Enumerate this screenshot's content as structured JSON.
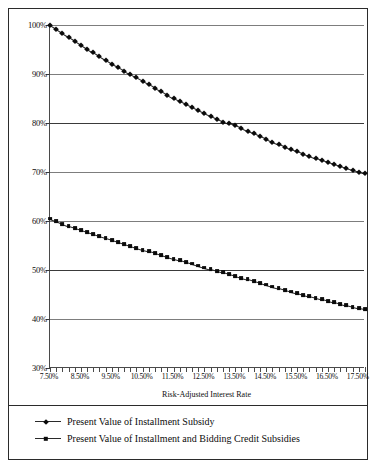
{
  "figure": {
    "xaxis_title": "Risk-Adjusted Interest Rate",
    "border_color": "#2b2b2b",
    "background": "#ffffff"
  },
  "legend": {
    "items": [
      {
        "label": "Present Value of Installment Subsidy",
        "marker": "diamond-marker",
        "color": "#0b0b0b"
      },
      {
        "label": "Present Value of Installment and Bidding Credit Subsidies",
        "marker": "square-marker",
        "color": "#0b0b0b"
      }
    ]
  },
  "chart_data": {
    "type": "line",
    "title": "",
    "xlabel": "Risk-Adjusted Interest Rate",
    "ylabel": "",
    "grid": true,
    "legend_position": "bottom",
    "xlim": [
      7.5,
      17.7
    ],
    "ylim": [
      30,
      100
    ],
    "ytick_labels": [
      "100%",
      "90%",
      "80%",
      "70%",
      "60%",
      "50%",
      "40%",
      "30%"
    ],
    "ytick_values": [
      100,
      90,
      80,
      70,
      60,
      50,
      40,
      30
    ],
    "xtick_labels": [
      "7.50%",
      "8.50%",
      "9.50%",
      "10.50%",
      "11.50%",
      "12.50%",
      "13.50%",
      "14.50%",
      "15.50%",
      "16.50%",
      "17.50%"
    ],
    "xtick_values": [
      7.5,
      8.5,
      9.5,
      10.5,
      11.5,
      12.5,
      13.5,
      14.5,
      15.5,
      16.5,
      17.5
    ],
    "x": [
      7.5,
      7.7,
      7.9,
      8.1,
      8.3,
      8.5,
      8.7,
      8.9,
      9.1,
      9.3,
      9.5,
      9.7,
      9.9,
      10.1,
      10.3,
      10.5,
      10.7,
      10.9,
      11.1,
      11.3,
      11.5,
      11.7,
      11.9,
      12.1,
      12.3,
      12.5,
      12.7,
      12.9,
      13.1,
      13.3,
      13.5,
      13.7,
      13.9,
      14.1,
      14.3,
      14.5,
      14.7,
      14.9,
      15.1,
      15.3,
      15.5,
      15.7,
      15.9,
      16.1,
      16.3,
      16.5,
      16.7,
      16.9,
      17.1,
      17.3,
      17.5,
      17.7
    ],
    "series": [
      {
        "name": "Present Value of Installment Subsidy",
        "marker": "diamond",
        "values": [
          100.0,
          99.2,
          98.4,
          97.6,
          96.8,
          96.0,
          95.2,
          94.4,
          93.6,
          92.8,
          92.0,
          91.4,
          90.7,
          90.0,
          89.3,
          88.6,
          87.9,
          87.2,
          86.5,
          85.8,
          85.1,
          84.4,
          83.8,
          83.2,
          82.6,
          82.0,
          81.4,
          80.8,
          80.3,
          79.9,
          79.5,
          79.0,
          78.4,
          77.9,
          77.3,
          76.8,
          76.2,
          75.7,
          75.2,
          74.7,
          74.2,
          73.7,
          73.3,
          72.8,
          72.4,
          72.0,
          71.6,
          71.2,
          70.8,
          70.4,
          70.0,
          69.7
        ]
      },
      {
        "name": "Present Value of Installment and Bidding Credit Subsidies",
        "marker": "square",
        "values": [
          60.5,
          60.0,
          59.4,
          58.9,
          58.5,
          58.1,
          57.7,
          57.3,
          56.9,
          56.5,
          56.1,
          55.7,
          55.3,
          54.9,
          54.5,
          54.1,
          53.8,
          53.5,
          53.1,
          52.7,
          52.3,
          52.0,
          51.6,
          51.3,
          50.9,
          50.5,
          50.2,
          49.8,
          49.5,
          49.1,
          48.8,
          48.4,
          48.1,
          47.7,
          47.4,
          47.0,
          46.6,
          46.3,
          45.9,
          45.6,
          45.3,
          44.9,
          44.6,
          44.3,
          44.0,
          43.7,
          43.4,
          43.1,
          42.8,
          42.5,
          42.2,
          42.0
        ]
      }
    ]
  }
}
